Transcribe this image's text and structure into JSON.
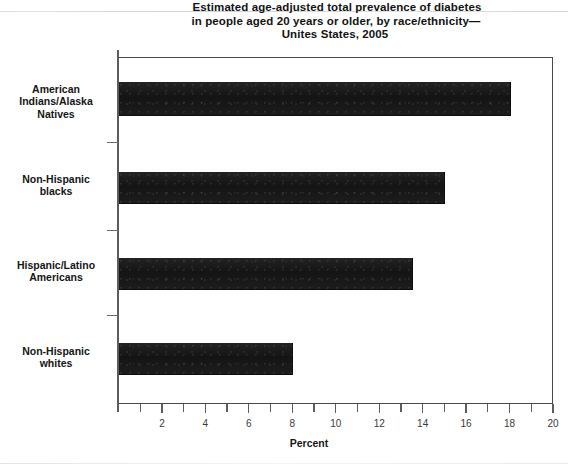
{
  "figure": {
    "title_lines": [
      "Estimated age-adjusted total prevalence of diabetes",
      "in people aged 20 years or older, by race/ethnicity—",
      "Unites States, 2005"
    ]
  },
  "chart_data": {
    "type": "bar",
    "orientation": "horizontal",
    "xlabel": "Percent",
    "ylabel": "",
    "categories": [
      "American Indians/Alaska Natives",
      "Non-Hispanic blacks",
      "Hispanic/Latino Americans",
      "Non-Hispanic whites"
    ],
    "category_label_lines": [
      [
        "American",
        "Indians/Alaska",
        "Natives"
      ],
      [
        "Non-Hispanic",
        "blacks"
      ],
      [
        "Hispanic/Latino",
        "Americans"
      ],
      [
        "Non-Hispanic",
        "whites"
      ]
    ],
    "values": [
      18.0,
      15.0,
      13.5,
      8.0
    ],
    "xlim": [
      0,
      20
    ],
    "xticks": [
      0,
      1,
      2,
      3,
      4,
      5,
      6,
      7,
      8,
      9,
      10,
      11,
      12,
      13,
      14,
      15,
      16,
      17,
      18,
      19,
      20
    ],
    "xtick_labels": [
      "2",
      "4",
      "6",
      "8",
      "10",
      "12",
      "14",
      "16",
      "18",
      "20"
    ],
    "xtick_label_values": [
      2,
      4,
      6,
      8,
      10,
      12,
      14,
      16,
      18,
      20
    ],
    "grid": false,
    "legend": null,
    "bar_color": "#1b1b1b",
    "axis_color": "#4a4a4a",
    "background": "#ffffff"
  }
}
